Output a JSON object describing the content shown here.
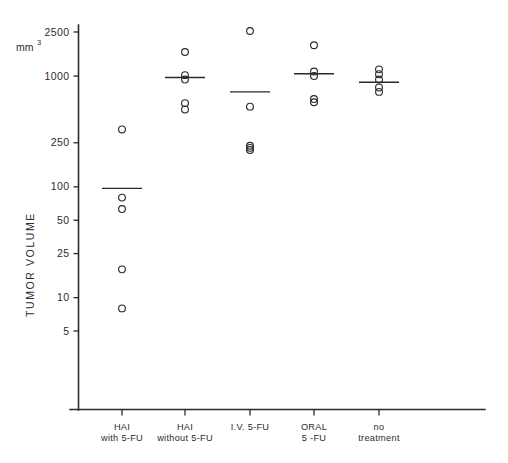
{
  "chart_data": {
    "type": "scatter",
    "title": "",
    "subtitle": "",
    "xlabel": "",
    "ylabel": "TUMOR  VOLUME",
    "yunit": "mm",
    "yunit_exponent": "3",
    "yscale": "log",
    "ylim": [
      4,
      3000
    ],
    "grid": false,
    "legend": false,
    "y_ticks": [
      {
        "value": 2500,
        "label": "2500"
      },
      {
        "value": 1000,
        "label": "1000"
      },
      {
        "value": 250,
        "label": "250"
      },
      {
        "value": 100,
        "label": "100"
      },
      {
        "value": 50,
        "label": "50"
      },
      {
        "value": 25,
        "label": "25"
      },
      {
        "value": 10,
        "label": "10"
      },
      {
        "value": 5,
        "label": "5"
      }
    ],
    "categories": [
      "HAI\nwith  5-FU",
      "HAI\nwithout 5-FU",
      "I.V. 5-FU",
      "ORAL\n5 -FU",
      "no\ntreatment"
    ],
    "series": [
      {
        "name": "HAI with 5-FU",
        "category_index": 0,
        "label_line1": "HAI",
        "label_line2": "with  5-FU",
        "values": [
          330,
          80,
          63,
          18,
          8
        ],
        "mean": 97
      },
      {
        "name": "HAI without 5-FU",
        "category_index": 1,
        "label_line1": "HAI",
        "label_line2": "without 5-FU",
        "values": [
          1650,
          1020,
          930,
          570,
          500
        ],
        "mean": 970
      },
      {
        "name": "I.V. 5-FU",
        "category_index": 2,
        "label_line1": "I.V. 5-FU",
        "label_line2": "",
        "values": [
          2550,
          530,
          235,
          225,
          215
        ],
        "mean": 720
      },
      {
        "name": "ORAL 5-FU",
        "category_index": 3,
        "label_line1": "ORAL",
        "label_line2": "5 -FU",
        "values": [
          1900,
          1100,
          1000,
          620,
          580
        ],
        "mean": 1050
      },
      {
        "name": "no treatment",
        "category_index": 4,
        "label_line1": "no",
        "label_line2": "treatment",
        "values": [
          1150,
          1040,
          930,
          790,
          720
        ],
        "mean": 880
      }
    ],
    "colors": {
      "axis": "#2b2b2b",
      "point_stroke": "#2b2b2b",
      "mean_line": "#2b2b2b",
      "background": "#ffffff"
    }
  }
}
